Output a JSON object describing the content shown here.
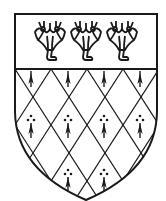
{
  "image": {
    "subject": "Heraldic shield (coat of arms)",
    "width": 166,
    "height": 201
  },
  "shield": {
    "field": "Ermine lozengy (diamond lattice with ermine spots)",
    "chief": "Chief charged with three flower/lily charges",
    "outline_color": "#1a1a1a",
    "background_color": "#ffffff",
    "chief_charges": [
      {
        "name": "flower",
        "cx": 50
      },
      {
        "name": "flower",
        "cx": 86
      },
      {
        "name": "flower",
        "cx": 122
      }
    ]
  }
}
